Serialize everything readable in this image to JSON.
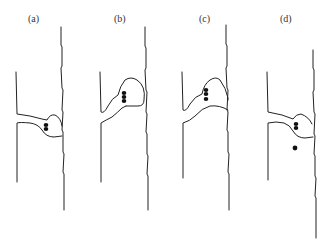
{
  "figure": {
    "panels": [
      {
        "id": "a",
        "label": "(a)",
        "stage": "small bulb at neck, particles inside"
      },
      {
        "id": "b",
        "label": "(b)",
        "stage": "bulb enlarged upward, particles inside"
      },
      {
        "id": "c",
        "label": "(c)",
        "stage": "bulb enlarged and contacting wall"
      },
      {
        "id": "d",
        "label": "(d)",
        "stage": "bulb retracted, one particle released below"
      }
    ],
    "colors": {
      "line": "#222222",
      "particle": "#111111",
      "background": "#ffffff"
    }
  }
}
